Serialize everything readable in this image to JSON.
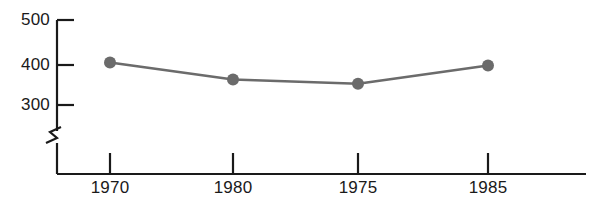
{
  "chart_data": {
    "type": "line",
    "title": "",
    "subtitle": "",
    "xlabel": "",
    "ylabel": "",
    "categories": [
      "1970",
      "1980",
      "1975",
      "1985"
    ],
    "values": [
      400,
      360,
      350,
      393
    ],
    "series": [
      {
        "name": "",
        "values": [
          400,
          360,
          350,
          393
        ]
      }
    ],
    "y_ticks": [
      "300",
      "400",
      "500"
    ],
    "y_tick_values": [
      300,
      400,
      500
    ],
    "ylim": [
      300,
      500
    ],
    "grid": false,
    "legend": "none",
    "axis_break": true,
    "axis_break_symbol": "zigzag",
    "marker": "filled-circle",
    "colors": {
      "line": "#6b6b6b",
      "marker": "#6b6b6b",
      "axis": "#1a1a1a",
      "text": "#1a1a1a",
      "background": "#ffffff"
    }
  }
}
